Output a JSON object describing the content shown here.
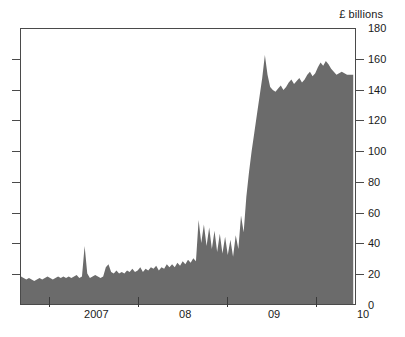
{
  "chart_data": {
    "type": "area",
    "title": "",
    "subtitle": "",
    "xlabel": "",
    "ylabel": "£ billions",
    "unit_caption": "£ billions",
    "grid": false,
    "legend": null,
    "series_color": "#6b6b6b",
    "axis_color": "#4a4a4a",
    "ylim": [
      0,
      180
    ],
    "ytick_values": [
      0,
      20,
      40,
      60,
      80,
      100,
      120,
      140,
      160,
      180
    ],
    "ytick_labels": [
      "0",
      "20",
      "40",
      "60",
      "80",
      "100",
      "120",
      "140",
      "160",
      "180"
    ],
    "ytick_side": "right",
    "xlim": [
      2006.42,
      2010.2
    ],
    "xtick_values": [
      2006.75,
      2007.75,
      2008.75,
      2009.75
    ],
    "xtick_labels": [
      "2007",
      "08",
      "09",
      "10"
    ],
    "x_start": 2006.42,
    "x_end": 2010.18,
    "series": [
      {
        "name": "£ billions",
        "color": "#6b6b6b",
        "x": [
          2006.42,
          2006.45,
          2006.48,
          2006.51,
          2006.54,
          2006.57,
          2006.6,
          2006.63,
          2006.66,
          2006.69,
          2006.72,
          2006.75,
          2006.78,
          2006.81,
          2006.84,
          2006.87,
          2006.9,
          2006.93,
          2006.96,
          2006.99,
          2007.02,
          2007.05,
          2007.08,
          2007.11,
          2007.14,
          2007.17,
          2007.2,
          2007.23,
          2007.26,
          2007.29,
          2007.32,
          2007.35,
          2007.38,
          2007.41,
          2007.44,
          2007.47,
          2007.5,
          2007.53,
          2007.56,
          2007.59,
          2007.62,
          2007.65,
          2007.68,
          2007.71,
          2007.74,
          2007.77,
          2007.8,
          2007.83,
          2007.86,
          2007.89,
          2007.92,
          2007.95,
          2007.98,
          2008.01,
          2008.04,
          2008.07,
          2008.1,
          2008.13,
          2008.16,
          2008.19,
          2008.22,
          2008.25,
          2008.28,
          2008.31,
          2008.34,
          2008.37,
          2008.4,
          2008.43,
          2008.46,
          2008.49,
          2008.52,
          2008.55,
          2008.58,
          2008.61,
          2008.64,
          2008.67,
          2008.7,
          2008.73,
          2008.76,
          2008.79,
          2008.82,
          2008.85,
          2008.88,
          2008.91,
          2008.94,
          2008.97,
          2009.0,
          2009.03,
          2009.06,
          2009.09,
          2009.12,
          2009.15,
          2009.18,
          2009.21,
          2009.24,
          2009.27,
          2009.3,
          2009.33,
          2009.36,
          2009.39,
          2009.42,
          2009.45,
          2009.48,
          2009.51,
          2009.54,
          2009.57,
          2009.6,
          2009.63,
          2009.66,
          2009.69,
          2009.72,
          2009.75,
          2009.78,
          2009.81,
          2009.84,
          2009.87,
          2009.9,
          2009.93,
          2009.96,
          2009.99,
          2010.02,
          2010.05,
          2010.08,
          2010.11,
          2010.14,
          2010.18
        ],
        "values": [
          18,
          17,
          16,
          17,
          16,
          15,
          16,
          17,
          16,
          17,
          18,
          17,
          16,
          17,
          18,
          17,
          18,
          17,
          18,
          17,
          18,
          19,
          17,
          18,
          38,
          20,
          17,
          18,
          19,
          18,
          17,
          18,
          24,
          26,
          21,
          20,
          22,
          20,
          21,
          20,
          22,
          21,
          23,
          21,
          22,
          24,
          21,
          23,
          22,
          24,
          23,
          25,
          22,
          24,
          23,
          26,
          24,
          26,
          24,
          27,
          25,
          28,
          26,
          29,
          27,
          30,
          28,
          55,
          40,
          52,
          38,
          50,
          36,
          48,
          34,
          46,
          33,
          44,
          32,
          42,
          31,
          45,
          36,
          58,
          47,
          70,
          86,
          100,
          112,
          124,
          136,
          148,
          163,
          150,
          142,
          140,
          139,
          141,
          143,
          140,
          142,
          145,
          147,
          144,
          146,
          148,
          145,
          147,
          150,
          152,
          149,
          151,
          155,
          158,
          156,
          159,
          157,
          154,
          152,
          150,
          151,
          152,
          151,
          150,
          150,
          150
        ]
      }
    ],
    "annotations": [
      {
        "label": "baseline 2006-2007",
        "value_range": [
          15,
          20
        ]
      },
      {
        "label": "spike mid-2007",
        "value": 38
      },
      {
        "label": "2008 volatility peak",
        "value": 55
      },
      {
        "label": "peak early 2009",
        "value": 163
      },
      {
        "label": "plateau 2009-2010",
        "value_range": [
          140,
          160
        ]
      },
      {
        "label": "final value",
        "value": 150
      }
    ]
  }
}
